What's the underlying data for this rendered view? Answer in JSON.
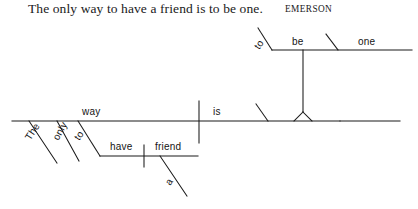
{
  "header": {
    "quote": "The only way to have a friend is to be one.",
    "attribution": "EMERSON"
  },
  "diagram": {
    "type": "reed-kellogg-sentence-diagram",
    "ink_color": "#1a1a1a",
    "background": "#ffffff",
    "labels": {
      "subject": "way",
      "article": "The",
      "adverb": "only",
      "infinitive_marker_subject": "to",
      "infinitive_verb": "have",
      "infinitive_object": "friend",
      "object_article": "a",
      "main_verb": "is",
      "complement_marker": "to",
      "complement_verb": "be",
      "predicate_nominative": "one"
    },
    "parts": [
      {
        "word": "The",
        "role": "article modifying way"
      },
      {
        "word": "only",
        "role": "adjective modifying way"
      },
      {
        "word": "to",
        "role": "infinitive marker"
      },
      {
        "word": "have",
        "role": "infinitive verb modifying way"
      },
      {
        "word": "friend",
        "role": "direct object of have"
      },
      {
        "word": "a",
        "role": "article modifying friend"
      },
      {
        "word": "way",
        "role": "subject"
      },
      {
        "word": "is",
        "role": "linking verb"
      },
      {
        "word": "to",
        "role": "infinitive marker"
      },
      {
        "word": "be",
        "role": "infinitive verb as predicate nominative"
      },
      {
        "word": "one",
        "role": "predicate nominative of be"
      }
    ]
  }
}
